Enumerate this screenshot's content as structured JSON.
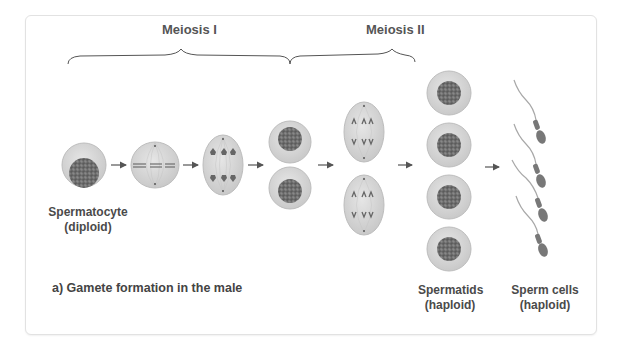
{
  "stages": {
    "meiosis_1": "Meiosis I",
    "meiosis_2": "Meiosis II"
  },
  "labels": {
    "spermatocyte": {
      "name": "Spermatocyte",
      "ploidy": "(diploid)"
    },
    "spermatids": {
      "name": "Spermatids",
      "ploidy": "(haploid)"
    },
    "sperm_cells": {
      "name": "Sperm cells",
      "ploidy": "(haploid)"
    }
  },
  "caption": "a) Gamete formation in the male",
  "colors": {
    "cell_fill": "#d4d4d4",
    "cell_edge": "#bdbdbd",
    "nucleus": "#6e6e6e",
    "text": "#4a4a4a",
    "card_border": "#e2e2e2"
  }
}
